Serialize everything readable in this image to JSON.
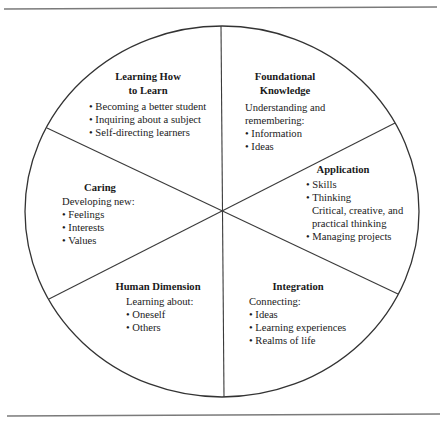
{
  "diagram": {
    "type": "six-segment circle",
    "colors": {
      "lines": "#333333",
      "text": "#1a1a1a",
      "rules": "#7a7a7a",
      "background": "#ffffff"
    },
    "segments": [
      {
        "id": "learning-how-to-learn",
        "title_lines": [
          "Learning How",
          "to Learn"
        ],
        "intro_lines": [],
        "items": [
          "• Becoming a better student",
          "• Inquiring about a subject",
          "• Self-directing learners"
        ]
      },
      {
        "id": "foundational-knowledge",
        "title_lines": [
          "Foundational",
          "Knowledge"
        ],
        "intro_lines": [
          "Understanding and",
          "remembering:"
        ],
        "items": [
          "• Information",
          "• Ideas"
        ]
      },
      {
        "id": "application",
        "title_lines": [
          "Application"
        ],
        "intro_lines": [],
        "items": [
          "• Skills",
          "• Thinking",
          "Critical, creative, and",
          "practical thinking",
          "• Managing projects"
        ]
      },
      {
        "id": "caring",
        "title_lines": [
          "Caring"
        ],
        "intro_lines": [
          "Developing new:"
        ],
        "items": [
          "• Feelings",
          "• Interests",
          "• Values"
        ]
      },
      {
        "id": "human-dimension",
        "title_lines": [
          "Human Dimension"
        ],
        "intro_lines": [
          "Learning about:"
        ],
        "items": [
          "• Oneself",
          "• Others"
        ]
      },
      {
        "id": "integration",
        "title_lines": [
          "Integration"
        ],
        "intro_lines": [
          "Connecting:"
        ],
        "items": [
          "• Ideas",
          "• Learning experiences",
          "• Realms of life"
        ]
      }
    ]
  }
}
